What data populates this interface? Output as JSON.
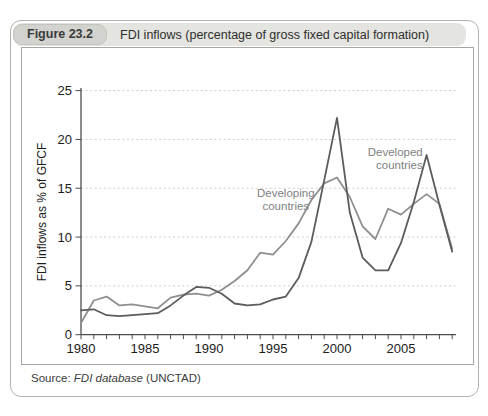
{
  "figure": {
    "badge": "Figure 23.2",
    "title": "FDI inflows (percentage of gross fixed capital formation)",
    "source_prefix": "Source: ",
    "source_italic": "FDI database",
    "source_suffix": " (UNCTAD)"
  },
  "chart_data": {
    "type": "line",
    "title": "FDI inflows (percentage of gross fixed capital formation)",
    "xlabel": "",
    "ylabel": "FDI inflows as % of GFCF",
    "xlim": [
      1980,
      2009
    ],
    "ylim": [
      0,
      25
    ],
    "xticks": [
      1980,
      1985,
      1990,
      1995,
      2000,
      2005
    ],
    "yticks": [
      0,
      5,
      10,
      15,
      20,
      25
    ],
    "grid": "horizontal-dotted",
    "legend_position": "inline-annotations",
    "x": [
      1980,
      1981,
      1982,
      1983,
      1984,
      1985,
      1986,
      1987,
      1988,
      1989,
      1990,
      1991,
      1992,
      1993,
      1994,
      1995,
      1996,
      1997,
      1998,
      1999,
      2000,
      2001,
      2002,
      2003,
      2004,
      2005,
      2006,
      2007,
      2008,
      2009
    ],
    "series": [
      {
        "name": "Developing countries",
        "color": "#8f8f8f",
        "values": [
          1.2,
          3.5,
          3.9,
          3.0,
          3.1,
          2.9,
          2.7,
          3.8,
          4.1,
          4.2,
          4.0,
          4.6,
          5.5,
          6.6,
          8.4,
          8.2,
          9.6,
          11.4,
          13.8,
          15.5,
          16.1,
          14.1,
          11.1,
          9.8,
          12.9,
          12.3,
          13.4,
          14.4,
          13.4,
          8.8
        ]
      },
      {
        "name": "Developed countries",
        "color": "#5c5c5c",
        "values": [
          2.5,
          2.6,
          2.0,
          1.9,
          2.0,
          2.1,
          2.2,
          3.0,
          4.0,
          4.9,
          4.8,
          4.2,
          3.2,
          3.0,
          3.1,
          3.6,
          3.9,
          5.8,
          9.5,
          15.8,
          22.2,
          12.5,
          7.9,
          6.6,
          6.6,
          9.4,
          13.6,
          18.4,
          13.3,
          8.5
        ]
      }
    ],
    "annotations": [
      {
        "lines": [
          "Developing",
          "countries"
        ],
        "year": 1996.0,
        "value": 14.1,
        "anchor": "middle"
      },
      {
        "lines": [
          "Developed",
          "countries"
        ],
        "year": 2006.7,
        "value": 18.3,
        "anchor": "end"
      }
    ]
  }
}
